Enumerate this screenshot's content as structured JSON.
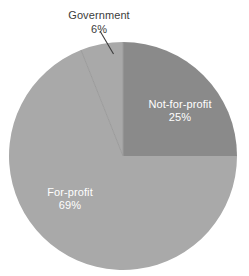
{
  "chart_data": {
    "type": "pie",
    "title": "",
    "subtitle": "",
    "xlabel": "",
    "ylabel": "",
    "legend_position": "none",
    "grid": false,
    "labels_on_slices": true,
    "start_angle_deg": 0,
    "direction": "clockwise",
    "categories": [
      "Not-for-profit",
      "For-profit",
      "Government"
    ],
    "values": [
      25,
      69,
      6
    ],
    "units": "percent",
    "slices": [
      {
        "name": "Not-for-profit",
        "label": "Not-for-profit",
        "value": 25,
        "value_text": "25%",
        "color": "#8a8a8a",
        "label_color": "#ffffff",
        "label_placement": "inside",
        "start_angle_deg": 0,
        "end_angle_deg": 90
      },
      {
        "name": "For-profit",
        "label": "For-profit",
        "value": 69,
        "value_text": "69%",
        "color": "#a9a9a9",
        "label_color": "#ffffff",
        "label_placement": "inside",
        "start_angle_deg": 90,
        "end_angle_deg": 338.4
      },
      {
        "name": "Government",
        "label": "Government",
        "value": 6,
        "value_text": "6%",
        "color": "#a9a9a9",
        "label_color": "#3c3c3c",
        "label_placement": "outside-leader-line",
        "start_angle_deg": 338.4,
        "end_angle_deg": 360
      }
    ],
    "geometry": {
      "center_x": 123,
      "center_y": 156,
      "radius": 114
    },
    "colors": {
      "background": "#ffffff",
      "not_for_profit": "#8a8a8a",
      "for_profit": "#a9a9a9",
      "government": "#a9a9a9",
      "divider": "#9b9b9b",
      "leader_line": "#3c3c3c",
      "inside_label_text": "#ffffff",
      "outside_label_text": "#3c3c3c"
    }
  }
}
